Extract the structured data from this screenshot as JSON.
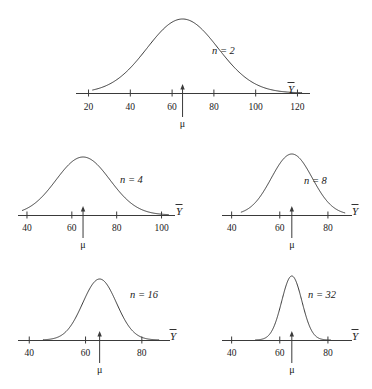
{
  "figure": {
    "axis_label": "Y",
    "axis_label_overbar": true,
    "mu_symbol": "μ",
    "mu_value": 65,
    "line_color": "#3a3a3a",
    "text_color": "#1a1a1a",
    "background": "#ffffff"
  },
  "chart_data": {
    "type": "line",
    "title": "",
    "subtitle": "",
    "xlabel": "Ȳ",
    "ylabel": "",
    "grid": false,
    "legend": "none",
    "panels": [
      {
        "id": "panel-n2",
        "n_label": "n = 2",
        "n": 2,
        "mean": 65,
        "sd": 17,
        "peak_x": 65,
        "axis_min": 14,
        "axis_max": 126,
        "ticks": [
          20,
          40,
          60,
          80,
          100,
          120
        ],
        "tick_labels": [
          "20",
          "40",
          "60",
          "80",
          "100",
          "120"
        ],
        "mu_tick": 65,
        "mu_label": "μ",
        "curve_x_start": 22,
        "curve_x_end": 122
      },
      {
        "id": "panel-n4",
        "n_label": "n = 4",
        "n": 4,
        "mean": 65,
        "sd": 12,
        "peak_x": 65,
        "axis_min": 36,
        "axis_max": 106,
        "ticks": [
          40,
          60,
          80,
          100
        ],
        "tick_labels": [
          "40",
          "60",
          "80",
          "100"
        ],
        "mu_tick": 65,
        "mu_label": "μ",
        "curve_x_start": 38,
        "curve_x_end": 103
      },
      {
        "id": "panel-n8",
        "n_label": "n = 8",
        "n": 8,
        "mean": 65,
        "sd": 8.5,
        "peak_x": 65,
        "axis_min": 36,
        "axis_max": 90,
        "ticks": [
          40,
          60,
          80
        ],
        "tick_labels": [
          "40",
          "60",
          "80"
        ],
        "mu_tick": 65,
        "mu_label": "μ",
        "curve_x_start": 44,
        "curve_x_end": 87
      },
      {
        "id": "panel-n16",
        "n_label": "n = 16",
        "n": 16,
        "mean": 65,
        "sd": 6,
        "peak_x": 65,
        "axis_min": 36,
        "axis_max": 90,
        "ticks": [
          40,
          60,
          80
        ],
        "tick_labels": [
          "40",
          "60",
          "80"
        ],
        "mu_tick": 65,
        "mu_label": "μ",
        "curve_x_start": 45,
        "curve_x_end": 86
      },
      {
        "id": "panel-n32",
        "n_label": "n = 32",
        "n": 32,
        "mean": 65,
        "sd": 4.2,
        "peak_x": 65,
        "axis_min": 36,
        "axis_max": 90,
        "ticks": [
          40,
          60,
          80
        ],
        "tick_labels": [
          "40",
          "60",
          "80"
        ],
        "mu_tick": 65,
        "mu_label": "μ",
        "curve_x_start": 50,
        "curve_x_end": 81
      }
    ]
  }
}
